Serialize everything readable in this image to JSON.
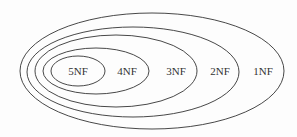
{
  "diagram": {
    "type": "nested-ellipses",
    "colors": {
      "stroke": "#333333",
      "background": "#fdfdfd",
      "text": "#333333"
    },
    "ellipses": [
      {
        "label": "1NF",
        "cx": 152,
        "cy": 71,
        "rx": 132,
        "ry": 58,
        "label_x": 263
      },
      {
        "label": "2NF",
        "cx": 133,
        "cy": 72,
        "rx": 106,
        "ry": 45,
        "label_x": 220
      },
      {
        "label": "3NF",
        "cx": 116,
        "cy": 71,
        "rx": 81,
        "ry": 36,
        "label_x": 176
      },
      {
        "label": "4NF",
        "cx": 96,
        "cy": 71,
        "rx": 53,
        "ry": 23,
        "label_x": 127
      },
      {
        "label": "5NF",
        "cx": 78,
        "cy": 71,
        "rx": 27,
        "ry": 15,
        "label_x": 78
      }
    ]
  }
}
